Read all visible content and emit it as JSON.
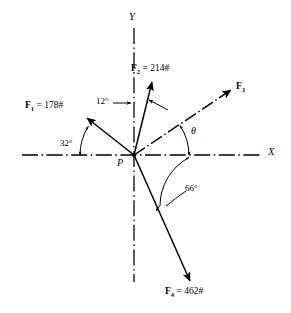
{
  "figure": {
    "origin_label": "P",
    "axes": {
      "x_label": "X",
      "y_label": "Y",
      "style": "dash-dot"
    },
    "vectors": [
      {
        "name": "F1",
        "label_force": "F",
        "label_sub": "1",
        "label_value": " = 178#",
        "magnitude": 178,
        "unit": "#",
        "angle_from_axis_deg": 32,
        "reference": "negative-x-axis",
        "direction_deg_ccw_from_pos_x": 148,
        "line_style": "solid"
      },
      {
        "name": "F2",
        "label_force": "F",
        "label_sub": "2",
        "label_value": " = 214#",
        "magnitude": 214,
        "unit": "#",
        "angle_from_axis_deg": 12,
        "reference": "positive-y-axis",
        "direction_deg_ccw_from_pos_x": 78,
        "line_style": "solid"
      },
      {
        "name": "F3",
        "label_force": "F",
        "label_sub": "3",
        "label_value": "",
        "magnitude": null,
        "unit": "",
        "angle_from_axis_deg": null,
        "reference": "positive-x-axis",
        "direction_deg_ccw_from_pos_x": 33,
        "line_style": "dash-dot"
      },
      {
        "name": "F4",
        "label_force": "F",
        "label_sub": "4",
        "label_value": " = 462#",
        "magnitude": 462,
        "unit": "#",
        "angle_from_axis_deg": 66,
        "reference": "positive-x-axis-clockwise",
        "direction_deg_ccw_from_pos_x": -66,
        "line_style": "solid"
      }
    ],
    "angles": [
      {
        "name": "angle-32",
        "text": "32°",
        "between": "F1 and negative X axis"
      },
      {
        "name": "angle-12",
        "text": "12°",
        "between": "F2 and positive Y axis"
      },
      {
        "name": "angle-theta",
        "text": "θ",
        "between": "F3 and positive X axis"
      },
      {
        "name": "angle-66",
        "text": "66°",
        "between": "F4 and positive X axis"
      }
    ],
    "colors": {
      "stroke": "#000000",
      "background": "#ffffff"
    }
  }
}
